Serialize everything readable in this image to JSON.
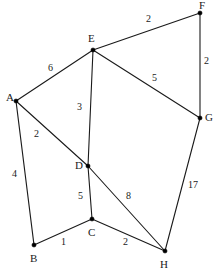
{
  "figure": {
    "name": "weighted-undirected-graph",
    "width": 218,
    "height": 273,
    "background_color": "#ffffff",
    "line_color": "#1a1a1a",
    "text_color": "#1a1a1a"
  },
  "graph_data": {
    "type": "node-link-diagram",
    "directed": false,
    "weighted": true,
    "nodes": [
      {
        "id": "A",
        "label": "A",
        "x": 16,
        "y": 101,
        "label_x": 6,
        "label_y": 92
      },
      {
        "id": "B",
        "label": "B",
        "x": 34,
        "y": 245,
        "label_x": 30,
        "label_y": 253
      },
      {
        "id": "C",
        "label": "C",
        "x": 92,
        "y": 219,
        "label_x": 88,
        "label_y": 227
      },
      {
        "id": "D",
        "label": "D",
        "x": 88,
        "y": 166,
        "label_x": 75,
        "label_y": 160
      },
      {
        "id": "E",
        "label": "E",
        "x": 93,
        "y": 50,
        "label_x": 88,
        "label_y": 33
      },
      {
        "id": "F",
        "label": "F",
        "x": 200,
        "y": 13,
        "label_x": 199,
        "label_y": 0
      },
      {
        "id": "G",
        "label": "G",
        "x": 200,
        "y": 118,
        "label_x": 205,
        "label_y": 112
      },
      {
        "id": "H",
        "label": "H",
        "x": 165,
        "y": 251,
        "label_x": 160,
        "label_y": 259
      }
    ],
    "edges": [
      {
        "source": "A",
        "target": "E",
        "weight": "6",
        "label_x": 48,
        "label_y": 63
      },
      {
        "source": "A",
        "target": "D",
        "weight": "2",
        "label_x": 34,
        "label_y": 129
      },
      {
        "source": "A",
        "target": "B",
        "weight": "4",
        "label_x": 12,
        "label_y": 169
      },
      {
        "source": "E",
        "target": "F",
        "weight": "2",
        "label_x": 146,
        "label_y": 14
      },
      {
        "source": "E",
        "target": "G",
        "weight": "5",
        "label_x": 152,
        "label_y": 73
      },
      {
        "source": "E",
        "target": "D",
        "weight": "3",
        "label_x": 77,
        "label_y": 102
      },
      {
        "source": "F",
        "target": "G",
        "weight": "2",
        "label_x": 204,
        "label_y": 56
      },
      {
        "source": "D",
        "target": "C",
        "weight": "5",
        "label_x": 78,
        "label_y": 191
      },
      {
        "source": "D",
        "target": "H",
        "weight": "8",
        "label_x": 126,
        "label_y": 191
      },
      {
        "source": "B",
        "target": "C",
        "weight": "1",
        "label_x": 61,
        "label_y": 237
      },
      {
        "source": "C",
        "target": "H",
        "weight": "2",
        "label_x": 123,
        "label_y": 237
      },
      {
        "source": "G",
        "target": "H",
        "weight": "17",
        "label_x": 188,
        "label_y": 180
      }
    ]
  }
}
